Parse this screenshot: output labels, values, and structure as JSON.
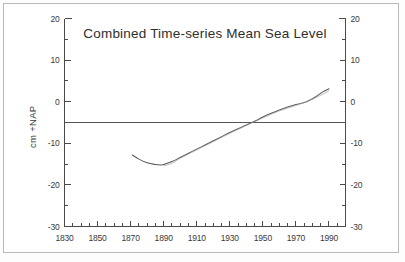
{
  "chart_data": {
    "type": "line",
    "title": "Combined Time-series Mean Sea Level",
    "xlabel": "",
    "ylabel": "cm +NAP",
    "xlim": [
      1830,
      2000
    ],
    "ylim": [
      -30,
      20
    ],
    "grid": false,
    "legend": null,
    "x_ticks": [
      1830,
      1850,
      1870,
      1890,
      1910,
      1930,
      1950,
      1970,
      1990
    ],
    "x_tick_labels": [
      "1830",
      "1850",
      "1870",
      "1890",
      "1910",
      "1930",
      "1950",
      "1970",
      "1990"
    ],
    "x_minor_tick_interval": 5,
    "y_ticks": [
      20,
      10,
      0,
      -10,
      -20,
      -30
    ],
    "y_tick_labels": [
      "20",
      "10",
      "0",
      "-10",
      "-20",
      "-30"
    ],
    "y_ticks_right": [
      20,
      10,
      0,
      -10,
      -20,
      -30
    ],
    "y_tick_labels_right": [
      "20",
      "10",
      "0",
      "-10",
      "-20",
      "-30"
    ],
    "y_minor_tick_interval": 5,
    "reference_line": {
      "name": "mean-level-reference",
      "orientation": "horizontal",
      "y": -5
    },
    "series": [
      {
        "name": "Combined mean sea level",
        "x": [
          1871,
          1875,
          1880,
          1885,
          1888,
          1890,
          1895,
          1900,
          1905,
          1910,
          1915,
          1920,
          1925,
          1930,
          1935,
          1940,
          1945,
          1950,
          1955,
          1960,
          1965,
          1970,
          1975,
          1978,
          1982,
          1986,
          1990
        ],
        "values": [
          -12.8,
          -13.8,
          -14.7,
          -15.1,
          -15.2,
          -15.1,
          -14.4,
          -13.4,
          -12.4,
          -11.4,
          -10.4,
          -9.4,
          -8.4,
          -7.4,
          -6.5,
          -5.6,
          -4.7,
          -3.7,
          -2.8,
          -2.0,
          -1.3,
          -0.7,
          -0.2,
          0.3,
          1.2,
          2.3,
          3.1
        ]
      },
      {
        "name": "Secondary trend overlay",
        "x": [
          1890,
          1895,
          1900,
          1910,
          1920,
          1930,
          1940,
          1950,
          1960,
          1970,
          1980,
          1990
        ],
        "values": [
          -15.4,
          -14.8,
          -13.6,
          -11.6,
          -9.6,
          -7.6,
          -5.7,
          -3.9,
          -2.2,
          -0.9,
          0.6,
          2.6
        ]
      }
    ],
    "axis_labels": {
      "left_axis_title": "cm +NAP"
    }
  },
  "figure": {
    "background": "#ffffff",
    "frame_color": "#b9b9b9",
    "axis_color": "#4a4a4a",
    "curve_color": "#5a5a5a"
  }
}
